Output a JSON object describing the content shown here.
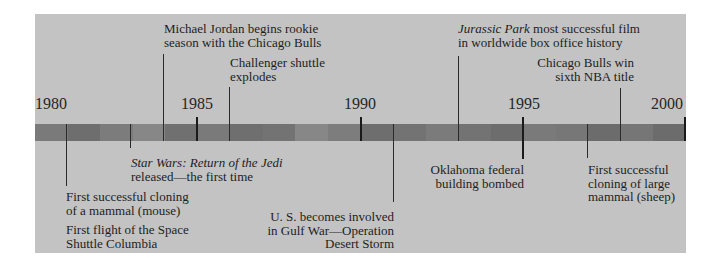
{
  "timeline": {
    "start_year": 1980,
    "end_year": 2000,
    "year_labels": [
      "1980",
      "1985",
      "1990",
      "1995",
      "2000"
    ],
    "colors": {
      "panel": "#c3c3c3",
      "bar_dark": "#6e6e6e",
      "bar_mid": "#7c7c7c",
      "bar_light": "#878787",
      "text": "#1e1e1e",
      "tick": "#1a1a1a"
    }
  },
  "events_above": [
    {
      "year": 1984,
      "line1": "Michael Jordan begins rookie",
      "line2": "season with the Chicago Bulls"
    },
    {
      "year": 1986,
      "line1": "Challenger shuttle",
      "line2": "explodes"
    },
    {
      "year": 1993,
      "line1_italic": "Jurassic Park",
      "line1_rest": " most successful  film",
      "line2": "in worldwide box office history"
    },
    {
      "year": 1998,
      "line1": "Chicago Bulls win",
      "line2": "sixth NBA title"
    }
  ],
  "events_below": [
    {
      "year": 1981,
      "line1": "First successful cloning",
      "line2": "of a mammal (mouse)",
      "line3": "First flight of the Space",
      "line4": "Shuttle Columbia"
    },
    {
      "year": 1983,
      "line1_italic": "Star Wars: Return of the Jedi",
      "line2": "released—the first time"
    },
    {
      "year": 1991,
      "line1": "U. S. becomes involved",
      "line2": "in Gulf War—Operation",
      "line3": "Desert Storm"
    },
    {
      "year": 1995,
      "line1": "Oklahoma federal",
      "line2": "building bombed"
    },
    {
      "year": 1997,
      "line1": "First successful",
      "line2": "cloning of large",
      "line3": "mammal (sheep)"
    }
  ]
}
